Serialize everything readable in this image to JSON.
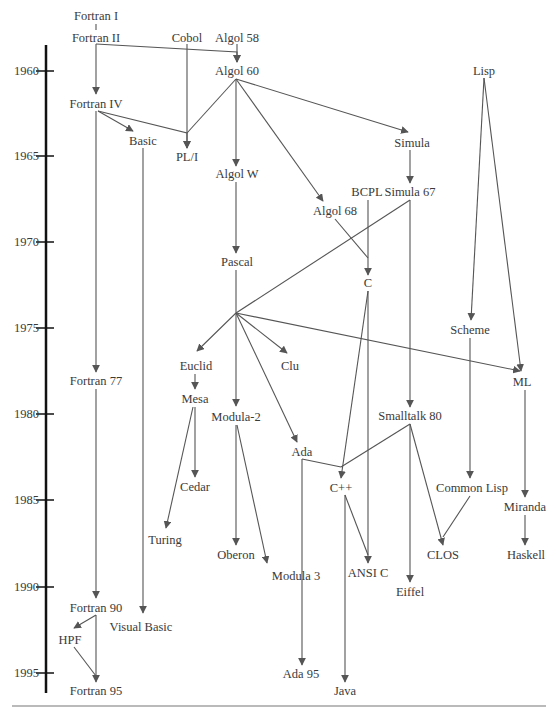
{
  "diagram": {
    "title": "",
    "axis": {
      "years": [
        {
          "label": "1960",
          "y": 71
        },
        {
          "label": "1965",
          "y": 156
        },
        {
          "label": "1970",
          "y": 242
        },
        {
          "label": "1975",
          "y": 328
        },
        {
          "label": "1980",
          "y": 414
        },
        {
          "label": "1985",
          "y": 500
        },
        {
          "label": "1990",
          "y": 587
        },
        {
          "label": "1995",
          "y": 673
        }
      ]
    },
    "nodes": [
      {
        "id": "fortran1",
        "label": "Fortran I",
        "x": 96,
        "y": 16
      },
      {
        "id": "fortran2",
        "label": "Fortran II",
        "x": 96,
        "y": 38
      },
      {
        "id": "cobol",
        "label": "Cobol",
        "x": 187,
        "y": 38
      },
      {
        "id": "algol58",
        "label": "Algol 58",
        "x": 237,
        "y": 38
      },
      {
        "id": "algol60",
        "label": "Algol 60",
        "x": 237,
        "y": 71
      },
      {
        "id": "lisp",
        "label": "Lisp",
        "x": 484,
        "y": 71
      },
      {
        "id": "fortran4",
        "label": "Fortran IV",
        "x": 96,
        "y": 104
      },
      {
        "id": "basic",
        "label": "Basic",
        "x": 143,
        "y": 141
      },
      {
        "id": "pl1",
        "label": "PL/I",
        "x": 187,
        "y": 157
      },
      {
        "id": "simula",
        "label": "Simula",
        "x": 412,
        "y": 143
      },
      {
        "id": "algolw",
        "label": "Algol W",
        "x": 237,
        "y": 174
      },
      {
        "id": "bcpl",
        "label": "BCPL",
        "x": 367,
        "y": 192
      },
      {
        "id": "simula67",
        "label": "Simula 67",
        "x": 410,
        "y": 192
      },
      {
        "id": "algol68",
        "label": "Algol 68",
        "x": 335,
        "y": 211
      },
      {
        "id": "pascal",
        "label": "Pascal",
        "x": 237,
        "y": 262
      },
      {
        "id": "c",
        "label": "C",
        "x": 368,
        "y": 283
      },
      {
        "id": "scheme",
        "label": "Scheme",
        "x": 470,
        "y": 330
      },
      {
        "id": "euclid",
        "label": "Euclid",
        "x": 196,
        "y": 366
      },
      {
        "id": "clu",
        "label": "Clu",
        "x": 290,
        "y": 366
      },
      {
        "id": "ml",
        "label": "ML",
        "x": 522,
        "y": 382
      },
      {
        "id": "fortran77",
        "label": "Fortran 77",
        "x": 96,
        "y": 381
      },
      {
        "id": "mesa",
        "label": "Mesa",
        "x": 195,
        "y": 399
      },
      {
        "id": "modula2",
        "label": "Modula-2",
        "x": 236,
        "y": 417
      },
      {
        "id": "smalltalk80",
        "label": "Smalltalk 80",
        "x": 410,
        "y": 416
      },
      {
        "id": "ada",
        "label": "Ada",
        "x": 302,
        "y": 452
      },
      {
        "id": "cedar",
        "label": "Cedar",
        "x": 195,
        "y": 487
      },
      {
        "id": "cpp",
        "label": "C++",
        "x": 341,
        "y": 488
      },
      {
        "id": "commonlisp",
        "label": "Common Lisp",
        "x": 472,
        "y": 488
      },
      {
        "id": "miranda",
        "label": "Miranda",
        "x": 525,
        "y": 507
      },
      {
        "id": "turing",
        "label": "Turing",
        "x": 165,
        "y": 540
      },
      {
        "id": "oberon",
        "label": "Oberon",
        "x": 236,
        "y": 555
      },
      {
        "id": "clos",
        "label": "CLOS",
        "x": 443,
        "y": 555
      },
      {
        "id": "haskell",
        "label": "Haskell",
        "x": 526,
        "y": 555
      },
      {
        "id": "modula3",
        "label": "Modula 3",
        "x": 296,
        "y": 576
      },
      {
        "id": "ansic",
        "label": "ANSI C",
        "x": 368,
        "y": 573
      },
      {
        "id": "eiffel",
        "label": "Eiffel",
        "x": 410,
        "y": 592
      },
      {
        "id": "fortran90",
        "label": "Fortran 90",
        "x": 96,
        "y": 608
      },
      {
        "id": "visualbasic",
        "label": "Visual Basic",
        "x": 141,
        "y": 627
      },
      {
        "id": "hpf",
        "label": "HPF",
        "x": 70,
        "y": 640
      },
      {
        "id": "ada95",
        "label": "Ada 95",
        "x": 301,
        "y": 674
      },
      {
        "id": "fortran95",
        "label": "Fortran 95",
        "x": 96,
        "y": 691
      },
      {
        "id": "java",
        "label": "Java",
        "x": 345,
        "y": 691
      }
    ],
    "edges": [
      {
        "from": "fortran1",
        "to": "fortran2",
        "arrow": false,
        "path": [
          [
            96,
            24
          ],
          [
            96,
            30
          ]
        ]
      },
      {
        "from": "fortran2",
        "to": "fortran4",
        "arrow": true,
        "path": [
          [
            96,
            44
          ],
          [
            96,
            94
          ]
        ]
      },
      {
        "from": "fortran2",
        "to": "algol60",
        "arrow": true,
        "path": [
          [
            96,
            44
          ],
          [
            237,
            52
          ],
          [
            237,
            62
          ]
        ]
      },
      {
        "from": "algol58",
        "to": "algol60",
        "arrow": true,
        "path": [
          [
            237,
            44
          ],
          [
            237,
            62
          ]
        ]
      },
      {
        "from": "cobol",
        "to": "pl1",
        "arrow": true,
        "path": [
          [
            187,
            44
          ],
          [
            187,
            148
          ]
        ]
      },
      {
        "from": "fortran4",
        "to": "basic",
        "arrow": true,
        "path": [
          [
            98,
            111
          ],
          [
            133,
            131
          ]
        ]
      },
      {
        "from": "fortran4",
        "to": "pl1",
        "arrow": true,
        "path": [
          [
            98,
            111
          ],
          [
            187,
            133
          ],
          [
            187,
            148
          ]
        ]
      },
      {
        "from": "algol60",
        "to": "pl1",
        "arrow": false,
        "path": [
          [
            236,
            79
          ],
          [
            187,
            133
          ]
        ]
      },
      {
        "from": "algol60",
        "to": "algolw",
        "arrow": true,
        "path": [
          [
            236,
            79
          ],
          [
            236,
            166
          ]
        ]
      },
      {
        "from": "algol60",
        "to": "simula",
        "arrow": true,
        "path": [
          [
            236,
            79
          ],
          [
            408,
            132
          ]
        ]
      },
      {
        "from": "algol60",
        "to": "algol68",
        "arrow": true,
        "path": [
          [
            236,
            79
          ],
          [
            323,
            201
          ]
        ]
      },
      {
        "from": "simula",
        "to": "simula67",
        "arrow": true,
        "path": [
          [
            410,
            150
          ],
          [
            410,
            183
          ]
        ]
      },
      {
        "from": "fortran4",
        "to": "fortran77",
        "arrow": true,
        "path": [
          [
            96,
            111
          ],
          [
            96,
            372
          ]
        ]
      },
      {
        "from": "basic",
        "to": "visualbasic",
        "arrow": true,
        "path": [
          [
            143,
            148
          ],
          [
            143,
            613
          ]
        ]
      },
      {
        "from": "algolw",
        "to": "pascal",
        "arrow": true,
        "path": [
          [
            236,
            182
          ],
          [
            236,
            253
          ]
        ]
      },
      {
        "from": "bcpl",
        "to": "c",
        "arrow": true,
        "path": [
          [
            368,
            200
          ],
          [
            368,
            275
          ]
        ]
      },
      {
        "from": "algol68",
        "to": "c",
        "arrow": false,
        "path": [
          [
            335,
            219
          ],
          [
            368,
            258
          ]
        ]
      },
      {
        "from": "simula67",
        "to": "pascal-branch",
        "arrow": false,
        "path": [
          [
            410,
            200
          ],
          [
            236,
            313
          ]
        ]
      },
      {
        "from": "simula67",
        "to": "smalltalk80",
        "arrow": true,
        "path": [
          [
            410,
            200
          ],
          [
            410,
            407
          ]
        ]
      },
      {
        "from": "pascal",
        "to": "euclid",
        "arrow": true,
        "path": [
          [
            236,
            270
          ],
          [
            236,
            313
          ],
          [
            197,
            351
          ]
        ]
      },
      {
        "from": "pascal",
        "to": "clu",
        "arrow": true,
        "path": [
          [
            236,
            313
          ],
          [
            287,
            353
          ]
        ]
      },
      {
        "from": "pascal",
        "to": "modula2",
        "arrow": true,
        "path": [
          [
            236,
            313
          ],
          [
            236,
            406
          ]
        ]
      },
      {
        "from": "pascal",
        "to": "ada",
        "arrow": true,
        "path": [
          [
            236,
            313
          ],
          [
            297,
            442
          ]
        ]
      },
      {
        "from": "pascal",
        "to": "ml",
        "arrow": true,
        "path": [
          [
            236,
            313
          ],
          [
            520,
            371
          ]
        ]
      },
      {
        "from": "lisp",
        "to": "scheme",
        "arrow": true,
        "path": [
          [
            484,
            78
          ],
          [
            471,
            320
          ]
        ]
      },
      {
        "from": "lisp",
        "to": "ml",
        "arrow": true,
        "path": [
          [
            484,
            78
          ],
          [
            521,
            371
          ]
        ]
      },
      {
        "from": "euclid",
        "to": "mesa",
        "arrow": true,
        "path": [
          [
            195,
            374
          ],
          [
            195,
            389
          ]
        ]
      },
      {
        "from": "mesa",
        "to": "cedar",
        "arrow": true,
        "path": [
          [
            195,
            407
          ],
          [
            195,
            477
          ]
        ]
      },
      {
        "from": "mesa",
        "to": "turing",
        "arrow": true,
        "path": [
          [
            193,
            407
          ],
          [
            166,
            528
          ]
        ]
      },
      {
        "from": "modula2",
        "to": "oberon",
        "arrow": true,
        "path": [
          [
            236,
            425
          ],
          [
            236,
            545
          ]
        ]
      },
      {
        "from": "modula2",
        "to": "modula3",
        "arrow": true,
        "path": [
          [
            237,
            425
          ],
          [
            267,
            563
          ]
        ]
      },
      {
        "from": "c",
        "to": "cpp",
        "arrow": true,
        "path": [
          [
            368,
            291
          ],
          [
            341,
            478
          ]
        ]
      },
      {
        "from": "c",
        "to": "ansic",
        "arrow": true,
        "path": [
          [
            368,
            291
          ],
          [
            368,
            563
          ]
        ]
      },
      {
        "from": "smalltalk80",
        "to": "cpp",
        "arrow": false,
        "path": [
          [
            410,
            424
          ],
          [
            341,
            467
          ]
        ]
      },
      {
        "from": "ada",
        "to": "cpp",
        "arrow": false,
        "path": [
          [
            302,
            459
          ],
          [
            341,
            467
          ]
        ]
      },
      {
        "from": "smalltalk80",
        "to": "eiffel",
        "arrow": true,
        "path": [
          [
            410,
            424
          ],
          [
            410,
            582
          ]
        ]
      },
      {
        "from": "smalltalk80",
        "to": "clos",
        "arrow": true,
        "path": [
          [
            410,
            424
          ],
          [
            443,
            545
          ]
        ]
      },
      {
        "from": "scheme",
        "to": "commonlisp",
        "arrow": true,
        "path": [
          [
            470,
            338
          ],
          [
            470,
            478
          ]
        ]
      },
      {
        "from": "commonlisp",
        "to": "clos",
        "arrow": false,
        "path": [
          [
            470,
            496
          ],
          [
            443,
            537
          ]
        ]
      },
      {
        "from": "ml",
        "to": "miranda",
        "arrow": true,
        "path": [
          [
            525,
            390
          ],
          [
            525,
            497
          ]
        ]
      },
      {
        "from": "miranda",
        "to": "haskell",
        "arrow": true,
        "path": [
          [
            525,
            515
          ],
          [
            525,
            545
          ]
        ]
      },
      {
        "from": "cpp",
        "to": "ansic",
        "arrow": false,
        "path": [
          [
            345,
            495
          ],
          [
            368,
            555
          ]
        ]
      },
      {
        "from": "cpp",
        "to": "java",
        "arrow": true,
        "path": [
          [
            345,
            495
          ],
          [
            345,
            682
          ]
        ]
      },
      {
        "from": "ada",
        "to": "ada95",
        "arrow": true,
        "path": [
          [
            302,
            459
          ],
          [
            302,
            665
          ]
        ]
      },
      {
        "from": "fortran77",
        "to": "fortran90",
        "arrow": true,
        "path": [
          [
            96,
            389
          ],
          [
            96,
            598
          ]
        ]
      },
      {
        "from": "fortran90",
        "to": "hpf",
        "arrow": true,
        "path": [
          [
            96,
            615
          ],
          [
            74,
            628
          ]
        ]
      },
      {
        "from": "fortran90",
        "to": "fortran95",
        "arrow": true,
        "path": [
          [
            96,
            615
          ],
          [
            96,
            682
          ]
        ]
      },
      {
        "from": "hpf",
        "to": "fortran95",
        "arrow": false,
        "path": [
          [
            74,
            647
          ],
          [
            96,
            676
          ]
        ]
      }
    ],
    "colors": {
      "edge": "#555555",
      "axis": "#111111",
      "text": "#3a3a3a",
      "rule": "#777777"
    }
  }
}
